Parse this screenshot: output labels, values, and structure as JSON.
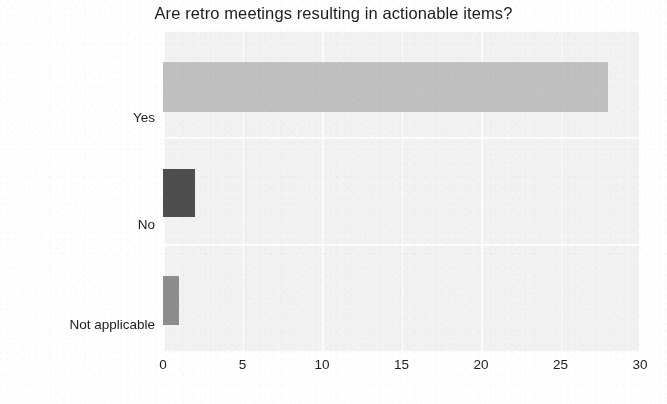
{
  "chart_data": {
    "type": "bar",
    "orientation": "horizontal",
    "title": "Are retro meetings resulting in actionable items?",
    "xlabel": "",
    "ylabel": "",
    "categories": [
      "Yes",
      "No",
      "Not applicable"
    ],
    "values": [
      28,
      2,
      1
    ],
    "xlim": [
      0,
      30
    ],
    "xticks": [
      0,
      5,
      10,
      15,
      20,
      25,
      30
    ],
    "xticklabels": [
      "0",
      "5",
      "10",
      "15",
      "20",
      "25",
      "30"
    ],
    "grid": true,
    "legend": false,
    "bar_colors": [
      "#c0c0c0",
      "#4e4e4e",
      "#8d8d8d"
    ],
    "plot_background": "#f2f2f2",
    "grid_color": "#fdfdfd",
    "text_color": "#1d1d1d"
  }
}
